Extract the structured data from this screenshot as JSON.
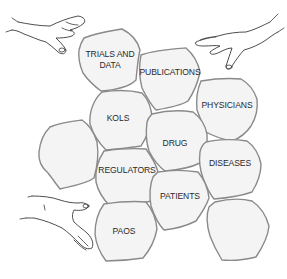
{
  "diagram": {
    "colors": {
      "piece_fill": "#f4f4f4",
      "piece_stroke": "#8a8a8a",
      "text": "#2a2a2a",
      "hand_stroke": "#3a3a3a"
    },
    "pieces": [
      {
        "id": "trials",
        "lines": [
          "TRIALS AND",
          "DATA"
        ]
      },
      {
        "id": "publications",
        "lines": [
          "PUBLICATIONS"
        ]
      },
      {
        "id": "physicians",
        "lines": [
          "PHYSICIANS"
        ]
      },
      {
        "id": "kols",
        "lines": [
          "KOLS"
        ]
      },
      {
        "id": "blank-left",
        "lines": []
      },
      {
        "id": "drug",
        "lines": [
          "DRUG"
        ]
      },
      {
        "id": "regulators",
        "lines": [
          "REGULATORS"
        ]
      },
      {
        "id": "diseases",
        "lines": [
          "DISEASES"
        ]
      },
      {
        "id": "patients",
        "lines": [
          "PATIENTS"
        ]
      },
      {
        "id": "paos",
        "lines": [
          "PAOS"
        ]
      },
      {
        "id": "blank-bottom-right",
        "lines": []
      }
    ],
    "hands": [
      {
        "id": "hand-top-left",
        "position": "top-left",
        "direction": "pointing-right"
      },
      {
        "id": "hand-top-right",
        "position": "top-right",
        "direction": "pointing-left"
      },
      {
        "id": "hand-bottom-left",
        "position": "bottom-left",
        "direction": "pointing-right"
      }
    ]
  }
}
